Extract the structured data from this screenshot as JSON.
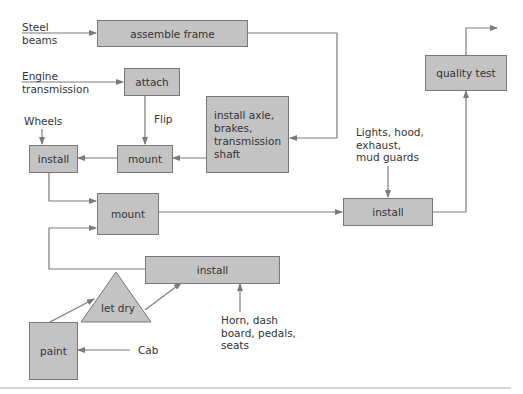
{
  "diagram": {
    "type": "assembly process flowchart",
    "colors": {
      "box_fill": "#c3c3c3",
      "box_border": "#777777",
      "line": "#7a7a7a",
      "text": "#333333"
    },
    "boxes": {
      "assemble_frame": "assemble frame",
      "attach": "attach",
      "install_axle": "install axle,\nbrakes,\ntransmission\nshaft",
      "mount_upper": "mount",
      "install_wheels": "install",
      "mount_lower": "mount",
      "install_lights": "install",
      "quality_test": "quality test",
      "install_interior": "install",
      "let_dry": "let dry",
      "paint": "paint"
    },
    "inputs": {
      "steel_beams": "Steel\nbeams",
      "engine_transmission": "Engine\ntransmission",
      "flip": "Flip",
      "wheels": "Wheels",
      "lights": "Lights, hood,\nexhaust,\nmud guards",
      "horn": "Horn, dash\nboard, pedals,\nseats",
      "cab": "Cab"
    }
  }
}
